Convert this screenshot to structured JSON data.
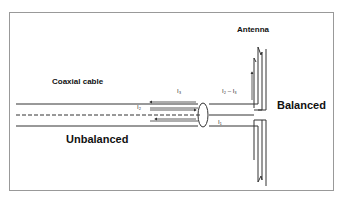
{
  "diagram": {
    "labels": {
      "antenna": "Antenna",
      "coaxial_cable": "Coaxial cable",
      "balanced": "Balanced",
      "unbalanced": "Unbalanced",
      "i3": "I₃",
      "i2": "I₂",
      "i1": "I₁",
      "i2_minus_i3": "I₂ – I₃"
    },
    "colors": {
      "line": "#333333",
      "border": "#888888",
      "text": "#111111"
    }
  }
}
